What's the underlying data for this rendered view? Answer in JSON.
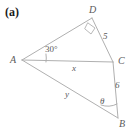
{
  "figure": {
    "part_label": "(a)",
    "type": "geometry-diagram",
    "stroke_color": "#b0b0b0",
    "label_color": "#5a5a5a",
    "background_color": "#ffffff",
    "vertices": [
      {
        "name": "A",
        "label": "A",
        "x": 22,
        "y": 60
      },
      {
        "name": "D",
        "label": "D",
        "x": 92,
        "y": 18
      },
      {
        "name": "C",
        "label": "C",
        "x": 113,
        "y": 62
      },
      {
        "name": "B",
        "label": "B",
        "x": 118,
        "y": 118
      }
    ],
    "segments": [
      {
        "name": "AD",
        "from": "A",
        "to": "D"
      },
      {
        "name": "DC",
        "from": "D",
        "to": "C",
        "length_label": "5"
      },
      {
        "name": "AC",
        "from": "A",
        "to": "C",
        "length_label": "x"
      },
      {
        "name": "CB",
        "from": "C",
        "to": "B",
        "length_label": "6"
      },
      {
        "name": "AB",
        "from": "A",
        "to": "B",
        "length_label": "y"
      }
    ],
    "measures": {
      "angle_A": "30°",
      "side_DC": "5",
      "side_AC": "x",
      "side_CB": "6",
      "side_AB": "y",
      "angle_B": "θ"
    },
    "markers": {
      "right_angle_at": "D",
      "angle_arc_at": "A",
      "theta_arc_at": "B"
    }
  }
}
